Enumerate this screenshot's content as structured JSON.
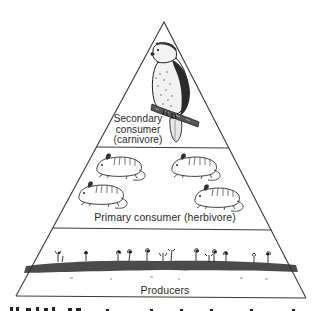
{
  "diagram": {
    "type": "trophic-pyramid",
    "levels": [
      {
        "id": "secondary",
        "label_lines": [
          "Secondary",
          "consumer",
          "(carnivore)"
        ],
        "organism": "hawk",
        "count": 1
      },
      {
        "id": "primary",
        "label": "Primary consumer (herbivore)",
        "organism": "mouse",
        "count": 4
      },
      {
        "id": "producers",
        "label": "Producers",
        "organism": "plants"
      }
    ],
    "colors": {
      "line": "#3a3a3a",
      "ink": "#1e1e1e",
      "background": "#ffffff"
    }
  }
}
